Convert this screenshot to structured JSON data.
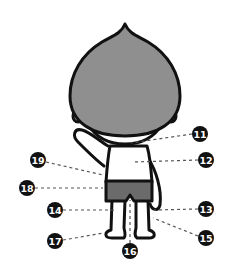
{
  "diagram": {
    "colors": {
      "head_fill": "#8f8f8f",
      "shorts_fill": "#6b6b6b",
      "outline": "#111111",
      "body_fill": "#ffffff",
      "badge_fill": "#111111",
      "badge_text": "#ffffff",
      "leader_line": "#555555",
      "background": "#ffffff"
    },
    "callouts": [
      {
        "label": "11",
        "badge": [
          200,
          134
        ],
        "target": [
          131,
          144
        ]
      },
      {
        "label": "12",
        "badge": [
          206,
          160
        ],
        "target": [
          133,
          162
        ]
      },
      {
        "label": "13",
        "badge": [
          206,
          209
        ],
        "target": [
          154,
          210
        ]
      },
      {
        "label": "14",
        "badge": [
          55,
          210
        ],
        "target": [
          116,
          210
        ]
      },
      {
        "label": "15",
        "badge": [
          206,
          238
        ],
        "target": [
          153,
          218
        ]
      },
      {
        "label": "16",
        "badge": [
          130,
          251
        ],
        "target": [
          130,
          200
        ]
      },
      {
        "label": "17",
        "badge": [
          55,
          241
        ],
        "target": [
          104,
          233
        ]
      },
      {
        "label": "18",
        "badge": [
          27,
          188
        ],
        "target": [
          103,
          188
        ]
      },
      {
        "label": "19",
        "badge": [
          38,
          160
        ],
        "target": [
          103,
          175
        ]
      }
    ]
  }
}
